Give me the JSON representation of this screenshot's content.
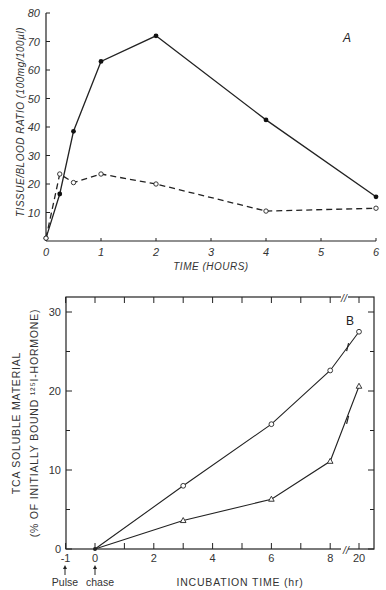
{
  "chart_data": [
    {
      "type": "line",
      "panel_label": "A",
      "title": "",
      "xlabel": "TIME (HOURS)",
      "ylabel": "TISSUE/BLOOD RATIO (100mg/100µl)",
      "xlim": [
        0,
        6
      ],
      "ylim": [
        0,
        80
      ],
      "x_ticks": [
        0,
        1,
        2,
        3,
        4,
        5,
        6
      ],
      "y_ticks": [
        10,
        20,
        30,
        40,
        50,
        60,
        70,
        80
      ],
      "grid": false,
      "legend": null,
      "series": [
        {
          "name": "filled circles (solid line)",
          "marker": "filled-circle",
          "line": "solid",
          "x": [
            0,
            0.25,
            0.5,
            1,
            2,
            4,
            6
          ],
          "y": [
            1,
            16.5,
            38.5,
            63,
            72,
            42.5,
            15.5
          ]
        },
        {
          "name": "open circles (dashed line)",
          "marker": "open-circle",
          "line": "dashed",
          "x": [
            0,
            0.25,
            0.5,
            1,
            2,
            4,
            6
          ],
          "y": [
            1,
            23.5,
            20.5,
            23.5,
            20,
            10.5,
            11.5
          ]
        }
      ]
    },
    {
      "type": "line",
      "panel_label": "B",
      "title": "",
      "xlabel": "INCUBATION TIME (hr)",
      "ylabel_line1": "TCA SOLUBLE MATERIAL",
      "ylabel_line2": "(% OF INITIALLY BOUND ¹²⁵I-HORMONE)",
      "xlim": [
        -1,
        20
      ],
      "ylim": [
        0,
        30
      ],
      "x_ticks": [
        -1,
        0,
        2,
        4,
        6,
        8,
        20
      ],
      "y_ticks": [
        0,
        10,
        20,
        30
      ],
      "axis_break": "between 8 and 20 on x-axis",
      "annotations": [
        {
          "text": "Pulse",
          "x": -1
        },
        {
          "text": "chase",
          "x": 0
        }
      ],
      "grid": false,
      "legend": null,
      "series": [
        {
          "name": "open circles",
          "marker": "open-circle",
          "line": "solid",
          "x": [
            0,
            3,
            6,
            8,
            20
          ],
          "y": [
            0,
            8,
            15.8,
            22.6,
            27.5
          ]
        },
        {
          "name": "open triangles",
          "marker": "open-triangle",
          "line": "solid",
          "x": [
            0,
            3,
            6,
            8,
            20
          ],
          "y": [
            0,
            3.6,
            6.3,
            11.1,
            20.6
          ]
        }
      ]
    }
  ],
  "chartA": {
    "panel_label": "A",
    "xlabel": "TIME (HOURS)",
    "ylabel": "TISSUE/BLOOD RATIO (100mg/100µl)",
    "x_tick_labels": [
      "0",
      "1",
      "2",
      "3",
      "4",
      "5",
      "6"
    ],
    "y_tick_labels": [
      "10",
      "20",
      "30",
      "40",
      "50",
      "60",
      "70",
      "80"
    ]
  },
  "chartB": {
    "panel_label": "B",
    "xlabel": "INCUBATION TIME (hr)",
    "ylabel_line1": "TCA  SOLUBLE  MATERIAL",
    "ylabel_line2": "(% OF INITIALLY BOUND ¹²⁵I-HORMONE)",
    "x_tick_labels": [
      "-1",
      "0",
      "2",
      "4",
      "6",
      "8",
      "20"
    ],
    "y_tick_labels": [
      "0",
      "10",
      "20",
      "30"
    ],
    "pulse_label": "Pulse",
    "chase_label": "chase",
    "break_mark": "//"
  }
}
